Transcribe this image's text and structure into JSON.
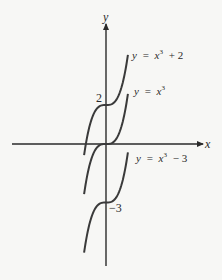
{
  "chart_data": {
    "type": "line",
    "title": "",
    "xlabel": "x",
    "ylabel": "y",
    "grid": false,
    "legend": "none (curves labeled inline)",
    "x_range": [
      -1.37,
      1.37
    ],
    "y_ticks_labeled": [
      2,
      -3
    ],
    "series": [
      {
        "name": "y = x³ + 2",
        "formula": "x^3 + 2",
        "shift": 2
      },
      {
        "name": "y = x³",
        "formula": "x^3",
        "shift": 0
      },
      {
        "name": "y = x³ − 3",
        "formula": "x^3 - 3",
        "shift": -3
      }
    ],
    "annotations": [
      {
        "text": "2",
        "at_y": 2
      },
      {
        "text": "−3",
        "at_y": -3
      }
    ]
  },
  "labels": {
    "x_axis": "x",
    "y_axis": "y",
    "tick_pos": "2",
    "tick_neg": "−3",
    "curve_top": {
      "lhs": "y",
      "eq": "=",
      "var": "x",
      "exp": "3",
      "rest": "+ 2"
    },
    "curve_mid": {
      "lhs": "y",
      "eq": "=",
      "var": "x",
      "exp": "3",
      "rest": ""
    },
    "curve_bot": {
      "lhs": "y",
      "eq": "=",
      "var": "x",
      "exp": "3",
      "rest": "− 3"
    }
  },
  "colors": {
    "ink": "#2a2a2a",
    "background": "#f7f7f5"
  }
}
